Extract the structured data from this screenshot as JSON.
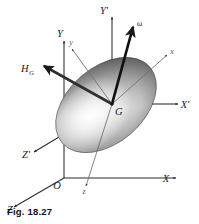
{
  "figure": {
    "caption": "Fig. 18.27",
    "background_color": "#ffffff",
    "ink_color": "#1a1a1a"
  },
  "labels": {
    "fixed_frame": {
      "y_axis": "Y",
      "x_axis": "X",
      "z_axis": "Z",
      "origin": "O"
    },
    "translating_frame": {
      "y_prime": "Y'",
      "x_prime": "X'",
      "z_prime": "Z'"
    },
    "body_frame": {
      "x_body": "x",
      "y_body": "y",
      "z_body": "z"
    },
    "center_of_mass": "G",
    "angular_velocity": "ω",
    "angular_momentum": "H",
    "angular_momentum_subscript": "G"
  },
  "vectors": [
    {
      "name": "angular-velocity-vector",
      "symbol": "ω",
      "from": "G",
      "direction": "up-right",
      "style": "solid-thick-arrow"
    },
    {
      "name": "angular-momentum-vector",
      "symbol": "H_G",
      "from": "G",
      "direction": "up-left",
      "style": "solid-thick-arrow"
    }
  ],
  "axes": [
    {
      "name": "Y",
      "type": "fixed",
      "style": "solid",
      "from": "O",
      "direction": "up"
    },
    {
      "name": "X",
      "type": "fixed",
      "style": "solid",
      "from": "O",
      "direction": "right"
    },
    {
      "name": "Z",
      "type": "fixed",
      "style": "solid",
      "from": "O",
      "direction": "down-left"
    },
    {
      "name": "Y'",
      "type": "translating",
      "style": "solid-and-dashed",
      "from": "G",
      "direction": "up"
    },
    {
      "name": "X'",
      "type": "translating",
      "style": "solid-and-dashed",
      "from": "G",
      "direction": "right"
    },
    {
      "name": "Z'",
      "type": "translating",
      "style": "solid-and-dashed",
      "from": "G",
      "direction": "down-left"
    },
    {
      "name": "x",
      "type": "body",
      "style": "thin-solid",
      "from": "G",
      "direction": "up-right"
    },
    {
      "name": "y",
      "type": "body",
      "style": "thin-solid",
      "from": "G",
      "direction": "up-left"
    },
    {
      "name": "z",
      "type": "body",
      "style": "thin-solid",
      "from": "G",
      "direction": "down"
    }
  ]
}
